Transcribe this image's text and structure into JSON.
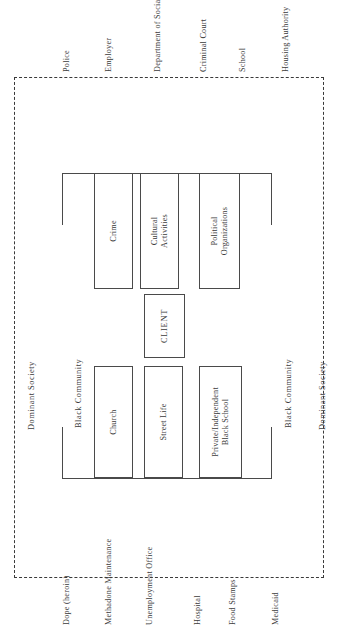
{
  "diagram": {
    "outer_boundary_label": "Dominant Society",
    "inner_boundary_label": "Black Community",
    "center_label": "CLIENT",
    "boundary_styles": {
      "outer": "dashed",
      "inner": "solid"
    },
    "colors": {
      "line": "#4a4a4a",
      "dashed_line": "#3a3a3a",
      "text": "#3b3b3b",
      "background": "#ffffff"
    },
    "side_labels": {
      "outer_left": "Dominant Society",
      "outer_right": "Dominant Society",
      "inner_left": "Black Community",
      "inner_right": "Black Community"
    },
    "dominant_society_top": [
      "Police",
      "Employer",
      "Department of Social Services",
      "Criminal Court",
      "School",
      "Housing Authority"
    ],
    "dominant_society_bottom": [
      "Dope (heroin)",
      "Methadone Maintenance",
      "Unemployment Office",
      "Hospital",
      "Food Stamps",
      "Medicaid"
    ],
    "black_community_upper": [
      "Crime",
      "Cultural\nActivities",
      "Political\nOrganizations"
    ],
    "black_community_lower": [
      "Church",
      "Street Life",
      "Private/Independent\nBlack School"
    ],
    "boxes": {
      "crime": "Crime",
      "cultural_activities_line1": "Cultural",
      "cultural_activities_line2": "Activities",
      "political_organizations_line1": "Political",
      "political_organizations_line2": "Organizations",
      "client": "CLIENT",
      "church": "Church",
      "street_life": "Street Life",
      "black_school_line1": "Private/Independent",
      "black_school_line2": "Black School"
    }
  }
}
